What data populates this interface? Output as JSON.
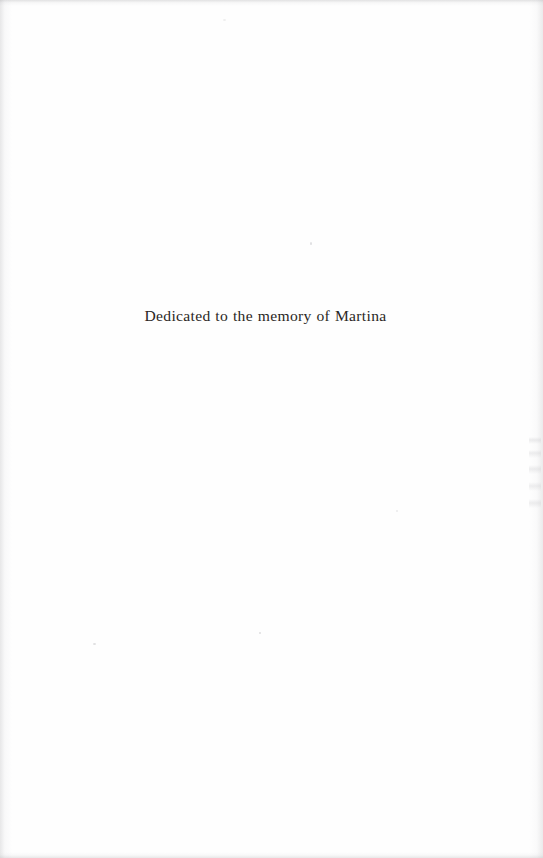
{
  "page": {
    "kind": "book-dedication-page",
    "width": 543,
    "height": 858,
    "background_color": "#fefefe",
    "text_color": "#2a2724"
  },
  "dedication": {
    "text": "Dedicated to the memory of Martina"
  }
}
